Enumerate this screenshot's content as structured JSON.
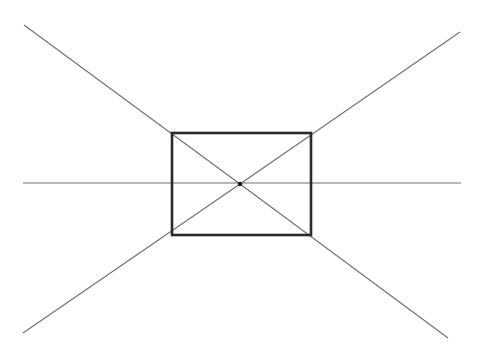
{
  "diagram": {
    "type": "one-point-perspective-construction",
    "canvas": {
      "width": 477,
      "height": 349,
      "background": "#ffffff"
    },
    "colors": {
      "thin_line": "#6e6e6e",
      "rectangle": "#2a2a2a",
      "vanishing_point": "#1a1a1a"
    },
    "horizon_line": {
      "x1": 23,
      "y1": 183,
      "x2": 461,
      "y2": 183
    },
    "rectangle": {
      "x": 172,
      "y": 133,
      "width": 139,
      "height": 102
    },
    "vanishing_point": {
      "cx": 240,
      "cy": 184,
      "r": 2.2
    },
    "orthogonals": [
      {
        "name": "top-left",
        "x1": 24,
        "y1": 25,
        "x2": 240,
        "y2": 184
      },
      {
        "name": "top-right",
        "x1": 460,
        "y1": 32,
        "x2": 240,
        "y2": 184
      },
      {
        "name": "bottom-left",
        "x1": 23,
        "y1": 333,
        "x2": 240,
        "y2": 184
      },
      {
        "name": "bottom-right",
        "x1": 448,
        "y1": 338,
        "x2": 240,
        "y2": 184
      }
    ]
  }
}
